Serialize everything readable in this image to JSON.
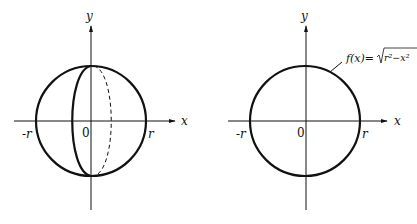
{
  "figures": [
    {
      "id": "sphere",
      "axis_x_label": "x",
      "axis_y_label": "y",
      "neg_r_label": "-r",
      "pos_r_label": "r",
      "origin_label": "0"
    },
    {
      "id": "circle",
      "axis_x_label": "x",
      "axis_y_label": "y",
      "neg_r_label": "-r",
      "pos_r_label": "r",
      "origin_label": "0",
      "function_label": "f(x)=√r²−x²",
      "function_prefix": "f(x)=",
      "function_radicand": "r²−x²"
    }
  ],
  "colors": {
    "stroke": "#111111",
    "background": "#ffffff"
  }
}
